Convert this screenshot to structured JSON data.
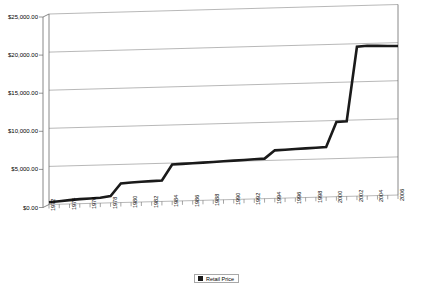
{
  "chart_data": {
    "type": "line",
    "title": "",
    "subtitle": "",
    "xlabel": "",
    "ylabel": "",
    "style": "3d-perspective-line",
    "grid": true,
    "legend_position": "bottom-center",
    "ylim": [
      0,
      25000
    ],
    "y_tick_labels": [
      "$25,000.00",
      "$20,000.00",
      "$15,000.00",
      "$10,000.00",
      "$5,000.00",
      "$0.00"
    ],
    "y_ticks": [
      25000,
      20000,
      15000,
      10000,
      5000,
      0
    ],
    "x_tick_labels": [
      "1972",
      "1974",
      "1976",
      "1978",
      "1980",
      "1982",
      "1984",
      "1986",
      "1988",
      "1990",
      "1992",
      "1994",
      "1996",
      "1998",
      "2000",
      "2002",
      "2004",
      "2006"
    ],
    "legend": [
      {
        "name": "Retail Price",
        "color": "#1a1a1a"
      }
    ],
    "series": [
      {
        "name": "Retail Price",
        "color": "#1a1a1a",
        "x": [
          1972,
          1973,
          1974,
          1975,
          1976,
          1977,
          1978,
          1979,
          1980,
          1981,
          1982,
          1983,
          1984,
          1985,
          1986,
          1987,
          1988,
          1989,
          1990,
          1991,
          1992,
          1993,
          1994,
          1995,
          1996,
          1997,
          1998,
          1999,
          2000,
          2001,
          2002,
          2003,
          2004,
          2005,
          2006
        ],
        "values": [
          300,
          400,
          500,
          600,
          650,
          700,
          900,
          2500,
          2600,
          2650,
          2700,
          2750,
          4800,
          4850,
          4900,
          4950,
          5000,
          5050,
          5100,
          5150,
          5200,
          5250,
          6300,
          6350,
          6400,
          6450,
          6500,
          6550,
          9800,
          9850,
          19600,
          19700,
          19650,
          19600,
          19550
        ]
      }
    ]
  }
}
